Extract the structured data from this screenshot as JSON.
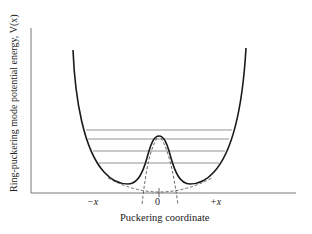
{
  "figure": {
    "y_axis_label": "Ring-puckering mode potential energy, V(x)",
    "x_axis_label": "Puckering coordinate",
    "tick_labels": {
      "minus": "−x",
      "zero": "0",
      "plus": "+x"
    },
    "colors": {
      "curve": "#1a1a1a",
      "axis": "#555555",
      "levels": "#666666",
      "dashed": "#444444",
      "background": "#ffffff"
    },
    "elements": {
      "potential_curve": "double-well potential with central barrier",
      "energy_levels_count": 4,
      "dashed_curves": [
        "harmonic parabola near origin",
        "two steep dashed branches of the barrier"
      ]
    }
  }
}
